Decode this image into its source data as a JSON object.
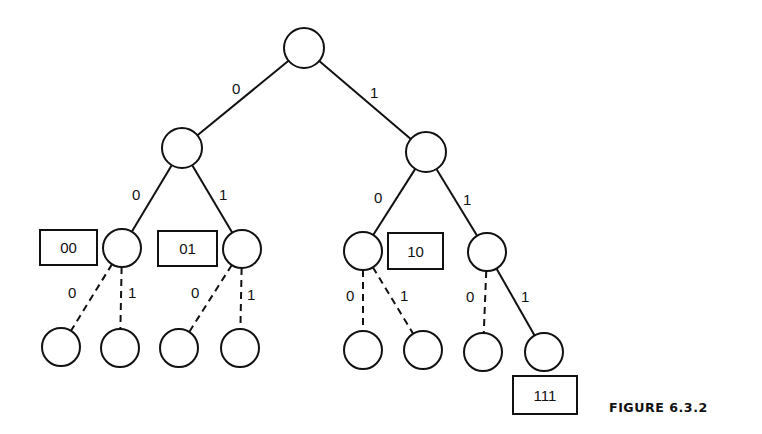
{
  "figure": {
    "caption": "FIGURE 6.3.2",
    "stroke_color": "#111111",
    "background": "#ffffff"
  },
  "nodes": [
    {
      "id": "root",
      "cx": 304,
      "cy": 48,
      "r": 20
    },
    {
      "id": "n0",
      "cx": 182,
      "cy": 148,
      "r": 20
    },
    {
      "id": "n1",
      "cx": 426,
      "cy": 152,
      "r": 20
    },
    {
      "id": "n00",
      "cx": 122,
      "cy": 248,
      "r": 19
    },
    {
      "id": "n01",
      "cx": 242,
      "cy": 249,
      "r": 19
    },
    {
      "id": "n10",
      "cx": 363,
      "cy": 251,
      "r": 19
    },
    {
      "id": "n11",
      "cx": 487,
      "cy": 252,
      "r": 19
    },
    {
      "id": "n000",
      "cx": 61,
      "cy": 347,
      "r": 19
    },
    {
      "id": "n001",
      "cx": 120,
      "cy": 348,
      "r": 19
    },
    {
      "id": "n010",
      "cx": 179,
      "cy": 348,
      "r": 19
    },
    {
      "id": "n011",
      "cx": 240,
      "cy": 348,
      "r": 19
    },
    {
      "id": "n100",
      "cx": 363,
      "cy": 350,
      "r": 19
    },
    {
      "id": "n101",
      "cx": 423,
      "cy": 350,
      "r": 19
    },
    {
      "id": "n110",
      "cx": 483,
      "cy": 352,
      "r": 19
    },
    {
      "id": "n111",
      "cx": 544,
      "cy": 352,
      "r": 19
    }
  ],
  "edges": [
    {
      "from": "root",
      "to": "n0",
      "label": "0",
      "lx": 232,
      "ly": 94,
      "style": "solid"
    },
    {
      "from": "root",
      "to": "n1",
      "label": "1",
      "lx": 370,
      "ly": 98,
      "style": "solid"
    },
    {
      "from": "n0",
      "to": "n00",
      "label": "0",
      "lx": 132,
      "ly": 200,
      "style": "solid"
    },
    {
      "from": "n0",
      "to": "n01",
      "label": "1",
      "lx": 219,
      "ly": 200,
      "style": "solid"
    },
    {
      "from": "n1",
      "to": "n10",
      "label": "0",
      "lx": 374,
      "ly": 203,
      "style": "solid"
    },
    {
      "from": "n1",
      "to": "n11",
      "label": "1",
      "lx": 463,
      "ly": 205,
      "style": "solid"
    },
    {
      "from": "n00",
      "to": "n000",
      "label": "0",
      "lx": 68,
      "ly": 298,
      "style": "dashed"
    },
    {
      "from": "n00",
      "to": "n001",
      "label": "1",
      "lx": 128,
      "ly": 298,
      "style": "dashed"
    },
    {
      "from": "n01",
      "to": "n010",
      "label": "0",
      "lx": 191,
      "ly": 298,
      "style": "dashed"
    },
    {
      "from": "n01",
      "to": "n011",
      "label": "1",
      "lx": 247,
      "ly": 300,
      "style": "dashed"
    },
    {
      "from": "n10",
      "to": "n100",
      "label": "0",
      "lx": 346,
      "ly": 301,
      "style": "dashed"
    },
    {
      "from": "n10",
      "to": "n101",
      "label": "1",
      "lx": 400,
      "ly": 301,
      "style": "dashed"
    },
    {
      "from": "n11",
      "to": "n110",
      "label": "0",
      "lx": 466,
      "ly": 302,
      "style": "dashed"
    },
    {
      "from": "n11",
      "to": "n111",
      "label": "1",
      "lx": 521,
      "ly": 302,
      "style": "solid"
    }
  ],
  "boxes": [
    {
      "label": "00",
      "x": 40,
      "y": 230,
      "w": 57,
      "h": 35
    },
    {
      "label": "01",
      "x": 158,
      "y": 231,
      "w": 59,
      "h": 35
    },
    {
      "label": "10",
      "x": 388,
      "y": 233,
      "w": 55,
      "h": 36
    },
    {
      "label": "111",
      "x": 513,
      "y": 376,
      "w": 64,
      "h": 38
    }
  ]
}
